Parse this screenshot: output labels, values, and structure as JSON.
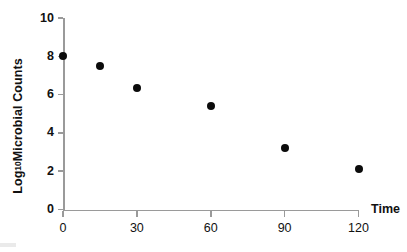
{
  "chart_data": {
    "type": "scatter",
    "title": "",
    "subtitle": "",
    "xlabel": "Time",
    "ylabel_prefix": "Log",
    "ylabel_subscript": "10",
    "ylabel_suffix": " Microbial Counts",
    "ylabel_full": "Log10 Microbial Counts",
    "x": [
      0,
      15,
      30,
      60,
      90,
      120
    ],
    "values": [
      8.0,
      7.5,
      6.35,
      5.4,
      3.2,
      2.1
    ],
    "points": [
      {
        "x": 0,
        "y": 8.0
      },
      {
        "x": 15,
        "y": 7.5
      },
      {
        "x": 30,
        "y": 6.35
      },
      {
        "x": 60,
        "y": 5.4
      },
      {
        "x": 90,
        "y": 3.2
      },
      {
        "x": 120,
        "y": 2.1
      }
    ],
    "xlim": [
      0,
      120
    ],
    "ylim": [
      0,
      10
    ],
    "xticks": [
      0,
      30,
      60,
      90,
      120
    ],
    "yticks": [
      0,
      2,
      4,
      6,
      8,
      10
    ],
    "xtick_labels": [
      "0",
      "30",
      "60",
      "90",
      "120"
    ],
    "ytick_labels": [
      "0",
      "2",
      "4",
      "6",
      "8",
      "10"
    ],
    "grid": false,
    "legend": false,
    "legend_position": "none",
    "marker": "filled-circle",
    "marker_color": "#0b0b0b",
    "axis_color": "#9a9a9a",
    "text_color": "#111111",
    "background": "#ffffff",
    "annotations": []
  }
}
